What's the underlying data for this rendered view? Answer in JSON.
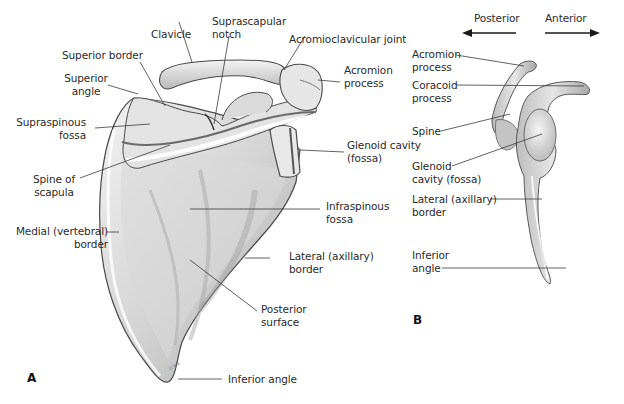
{
  "figure": {
    "panels": [
      {
        "id": "A",
        "letter": "A",
        "view": "posterior view of right scapula",
        "labels": {
          "clavicle": "Clavicle",
          "suprascapular_notch_1": "Suprascapular",
          "suprascapular_notch_2": "notch",
          "acromioclavicular_joint": "Acromioclavicular joint",
          "superior_border": "Superior border",
          "superior_angle_1": "Superior",
          "superior_angle_2": "angle",
          "acromion_process_1": "Acromion",
          "acromion_process_2": "process",
          "supraspinous_fossa_1": "Supraspinous",
          "supraspinous_fossa_2": "fossa",
          "glenoid_cavity_1": "Glenoid cavity",
          "glenoid_cavity_2": "(fossa)",
          "spine_of_scapula_1": "Spine of",
          "spine_of_scapula_2": "scapula",
          "infraspinous_fossa_1": "Infraspinous",
          "infraspinous_fossa_2": "fossa",
          "medial_border_1": "Medial (vertebral)",
          "medial_border_2": "border",
          "lateral_border_1": "Lateral (axillary)",
          "lateral_border_2": "border",
          "posterior_surface_1": "Posterior",
          "posterior_surface_2": "surface",
          "inferior_angle": "Inferior angle"
        }
      },
      {
        "id": "B",
        "letter": "B",
        "view": "lateral view of scapula",
        "direction": {
          "posterior": "Posterior",
          "anterior": "Anterior"
        },
        "labels": {
          "acromion_process_1": "Acromion",
          "acromion_process_2": "process",
          "coracoid_process_1": "Coracoid",
          "coracoid_process_2": "process",
          "spine": "Spine",
          "glenoid_cavity_1": "Glenoid",
          "glenoid_cavity_2": "cavity (fossa)",
          "lateral_border_1": "Lateral (axillary)",
          "lateral_border_2": "border",
          "inferior_angle_1": "Inferior",
          "inferior_angle_2": "angle"
        }
      }
    ],
    "colors": {
      "bone_light": "#ececec",
      "bone_mid": "#c9c9c9",
      "bone_dark": "#8d8d8d",
      "outline": "#4a4a4a",
      "leader_line": "#3a3a3a",
      "text": "#2b2b2b"
    }
  }
}
